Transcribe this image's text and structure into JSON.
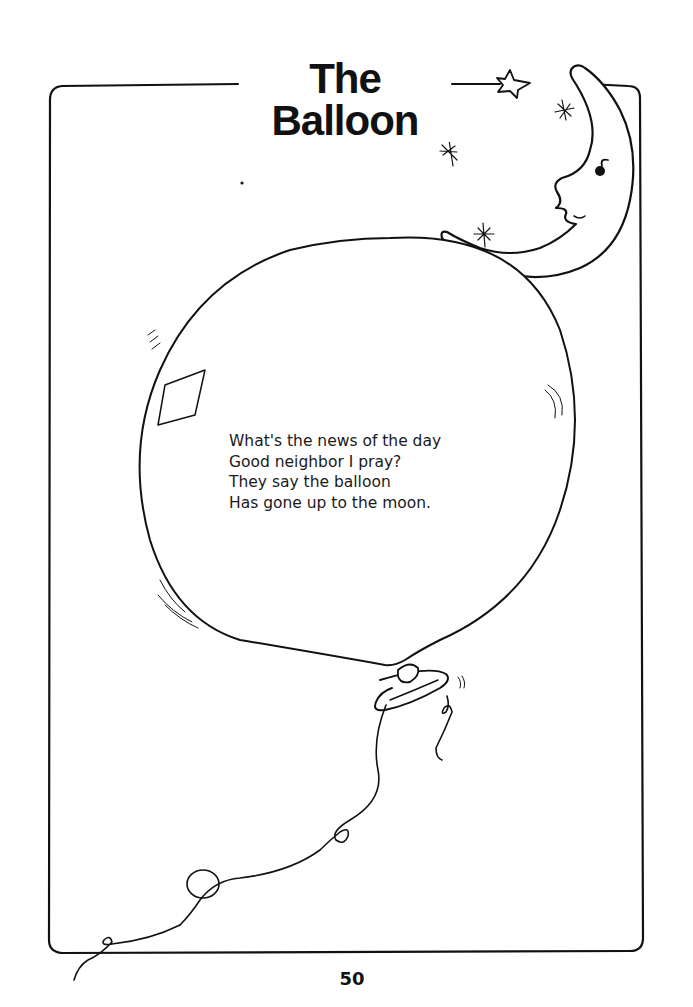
{
  "page": {
    "title": "The Balloon",
    "poem_lines": [
      "What's the news of the day",
      "Good neighbor I pray?",
      "They say the balloon",
      "Has gone up to the moon."
    ],
    "page_number": "50"
  },
  "illustration": {
    "elements": [
      "decorative-frame",
      "crescent-moon-face",
      "star",
      "sparkles",
      "balloon",
      "balloon-string"
    ],
    "line_color": "#111111",
    "background": "#ffffff"
  }
}
